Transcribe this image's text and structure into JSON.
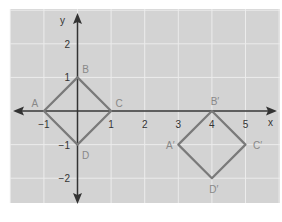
{
  "figure": {
    "background_color": "#ffffff",
    "plot_bg_color": "#d3d3d3",
    "grid_color": "#ececec",
    "axis_color": "#333333",
    "shape_color": "#7a7a7a",
    "label_color": "#888888",
    "tick_color": "#333333"
  },
  "axes": {
    "x_label": "x",
    "y_label": "y",
    "x_ticks": [
      {
        "value": -1,
        "label": "−1"
      },
      {
        "value": 1,
        "label": "1"
      },
      {
        "value": 2,
        "label": "2"
      },
      {
        "value": 3,
        "label": "3"
      },
      {
        "value": 4,
        "label": "4"
      },
      {
        "value": 5,
        "label": "5"
      }
    ],
    "y_ticks": [
      {
        "value": 2,
        "label": "2"
      },
      {
        "value": 1,
        "label": "1"
      },
      {
        "value": -1,
        "label": "−1"
      },
      {
        "value": -2,
        "label": "−2"
      }
    ],
    "x_range": [
      -2,
      6
    ],
    "y_range": [
      -3,
      3
    ]
  },
  "shapes": [
    {
      "name": "ABCD",
      "vertices": [
        {
          "label": "A",
          "x": -1,
          "y": 0
        },
        {
          "label": "B",
          "x": 0,
          "y": 1
        },
        {
          "label": "C",
          "x": 1,
          "y": 0
        },
        {
          "label": "D",
          "x": 0,
          "y": -1
        }
      ]
    },
    {
      "name": "A'B'C'D'",
      "vertices": [
        {
          "label": "A′",
          "x": 3,
          "y": -1
        },
        {
          "label": "B′",
          "x": 4,
          "y": 0
        },
        {
          "label": "C′",
          "x": 5,
          "y": -1
        },
        {
          "label": "D′",
          "x": 4,
          "y": -2
        }
      ]
    }
  ]
}
